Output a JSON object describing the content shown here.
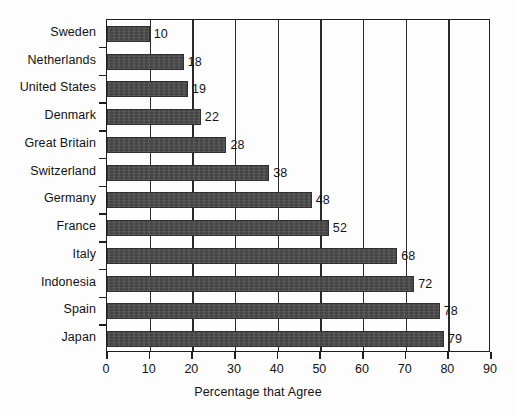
{
  "chart_data": {
    "type": "bar",
    "orientation": "horizontal",
    "title": "",
    "xlabel": "Percentage that Agree",
    "ylabel": "",
    "categories": [
      "Sweden",
      "Netherlands",
      "United States",
      "Denmark",
      "Great Britain",
      "Switzerland",
      "Germany",
      "France",
      "Italy",
      "Indonesia",
      "Spain",
      "Japan"
    ],
    "values": [
      10,
      18,
      19,
      22,
      28,
      38,
      48,
      52,
      68,
      72,
      78,
      79
    ],
    "data_labels": [
      "10",
      "18",
      "19",
      "22",
      "28",
      "38",
      "48",
      "52",
      "68",
      "72",
      "78",
      "79"
    ],
    "xlim": [
      0,
      90
    ],
    "xticks": [
      0,
      10,
      20,
      30,
      40,
      50,
      60,
      70,
      80,
      90
    ],
    "xtick_labels": [
      "0",
      "10",
      "20",
      "30",
      "40",
      "50",
      "60",
      "70",
      "80",
      "90"
    ],
    "grid": "vertical",
    "legend": null,
    "bar_color": "#4b4b4b",
    "axis_color": "#1d1d1d",
    "background_color": "#fdfdfd"
  }
}
